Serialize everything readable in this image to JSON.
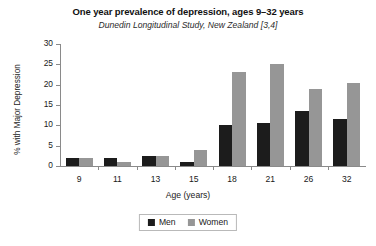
{
  "chart_data": {
    "type": "bar",
    "title": "One year prevalence of depression, ages 9–32 years",
    "subtitle": "Dunedin Longitudinal Study, New Zealand [3,4]",
    "xlabel": "Age (years)",
    "ylabel": "% with Major Depression",
    "categories": [
      "9",
      "11",
      "13",
      "15",
      "18",
      "21",
      "26",
      "32"
    ],
    "series": [
      {
        "name": "Men",
        "color": "#1c1c1c",
        "values": [
          2,
          2,
          2.5,
          1,
          10,
          10.5,
          13.5,
          11.5
        ]
      },
      {
        "name": "Women",
        "color": "#969696",
        "values": [
          2,
          1,
          2.5,
          4,
          23,
          25,
          19,
          20.5
        ]
      }
    ],
    "ylim": [
      0,
      30
    ],
    "yticks": [
      0,
      5,
      10,
      15,
      20,
      25,
      30
    ],
    "ytick_labels": [
      "0",
      "5",
      "10",
      "15",
      "20",
      "25",
      "30"
    ],
    "grid": false,
    "legend_position": "bottom-center"
  }
}
